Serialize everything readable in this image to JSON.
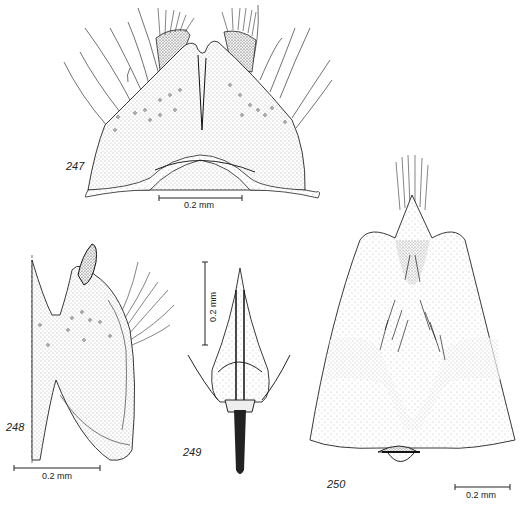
{
  "plate": {
    "figures": [
      {
        "id": "247",
        "label": "247",
        "scale_bar": "0.2 mm"
      },
      {
        "id": "248",
        "label": "248",
        "scale_bar": "0.2 mm"
      },
      {
        "id": "249",
        "label": "249",
        "scale_bar": "0.2 mm"
      },
      {
        "id": "250",
        "label": "250",
        "scale_bar": "0.2 mm"
      }
    ]
  }
}
